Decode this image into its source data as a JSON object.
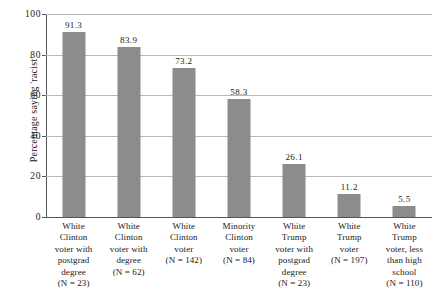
{
  "chart_data": {
    "type": "bar",
    "title": "",
    "xlabel": "",
    "ylabel": "Percentage saying 'racist'",
    "ylim": [
      0,
      100
    ],
    "yticks": [
      0,
      20,
      40,
      60,
      80,
      100
    ],
    "ytick_labels": [
      "0",
      "20",
      "40",
      "60",
      "80",
      "100"
    ],
    "grid": true,
    "legend": false,
    "bar_color": "#8c8c8c",
    "categories": [
      "White Clinton voter with postgrad degree",
      "White Clinton voter with degree",
      "White Clinton voter",
      "Minority Clinton voter",
      "White Trump voter with postgrad degree",
      "White Trump voter",
      "White Trump voter, less than high school"
    ],
    "category_lines": [
      [
        "White",
        "Clinton",
        "voter with",
        "postgrad",
        "degree"
      ],
      [
        "White",
        "Clinton",
        "voter with",
        "degree"
      ],
      [
        "White",
        "Clinton",
        "voter"
      ],
      [
        "Minority",
        "Clinton",
        "voter"
      ],
      [
        "White",
        "Trump",
        "voter with",
        "postgrad",
        "degree"
      ],
      [
        "White",
        "Trump",
        "voter"
      ],
      [
        "White",
        "Trump",
        "voter, less",
        "than high",
        "school"
      ]
    ],
    "sample_sizes": [
      "(N = 23)",
      "(N = 62)",
      "(N = 142)",
      "(N = 84)",
      "(N = 23)",
      "(N = 197)",
      "(N = 110)"
    ],
    "values": [
      91.3,
      83.9,
      73.2,
      58.3,
      26.1,
      11.2,
      5.5
    ],
    "value_labels": [
      "91.3",
      "83.9",
      "73.2",
      "58.3",
      "26.1",
      "11.2",
      "5.5"
    ]
  }
}
